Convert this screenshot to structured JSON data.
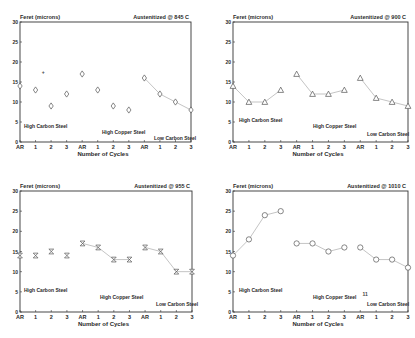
{
  "chart_data": [
    {
      "type": "line",
      "title": "Austenitized @ 845 C",
      "ylabel": "Feret (microns)",
      "xlabel": "Number of Cycles",
      "ylim": [
        0,
        30
      ],
      "yticks": [
        0,
        5,
        10,
        15,
        20,
        25,
        30
      ],
      "categories": [
        "AR",
        "1",
        "2",
        "3",
        "AR",
        "1",
        "2",
        "3",
        "AR",
        "1",
        "2",
        "3"
      ],
      "marker": "diamond",
      "grid": false,
      "series": [
        {
          "name": "High Carbon Steel",
          "values": [
            14,
            13,
            9,
            12
          ],
          "connected": false
        },
        {
          "name": "High Copper Steel",
          "values": [
            17,
            13,
            9,
            8
          ],
          "connected": false
        },
        {
          "name": "Low Carbon Steel",
          "values": [
            16,
            12,
            10,
            8
          ],
          "connected": true
        }
      ],
      "annotations": [
        {
          "text": "+",
          "x_index": 0.7,
          "y": 17
        }
      ]
    },
    {
      "type": "line",
      "title": "Austenitized @ 900 C",
      "ylabel": "Feret (microns)",
      "xlabel": "Number of Cycles",
      "ylim": [
        0,
        30
      ],
      "yticks": [
        0,
        5,
        10,
        15,
        20,
        25,
        30
      ],
      "categories": [
        "AR",
        "1",
        "2",
        "3",
        "AR",
        "1",
        "2",
        "3",
        "AR",
        "1",
        "2",
        "3"
      ],
      "marker": "triangle",
      "grid": false,
      "series": [
        {
          "name": "High Carbon Steel",
          "values": [
            14,
            10,
            10,
            13
          ],
          "connected": true
        },
        {
          "name": "High Copper Steel",
          "values": [
            17,
            12,
            12,
            13
          ],
          "connected": true
        },
        {
          "name": "Low Carbon Steel",
          "values": [
            16,
            11,
            10,
            9
          ],
          "connected": true
        }
      ]
    },
    {
      "type": "line",
      "title": "Austenitized @ 955 C",
      "ylabel": "Feret (microns)",
      "xlabel": "Number of Cycles",
      "ylim": [
        0,
        30
      ],
      "yticks": [
        0,
        5,
        10,
        15,
        20,
        25,
        30
      ],
      "categories": [
        "AR",
        "1",
        "2",
        "3",
        "AR",
        "1",
        "2",
        "3",
        "AR",
        "1",
        "2",
        "3"
      ],
      "marker": "hourglass",
      "grid": false,
      "series": [
        {
          "name": "High Carbon Steel",
          "values": [
            14,
            14,
            15,
            14
          ],
          "connected": false
        },
        {
          "name": "High Copper Steel",
          "values": [
            17,
            16,
            13,
            13
          ],
          "connected": true
        },
        {
          "name": "Low Carbon Steel",
          "values": [
            16,
            15,
            10,
            10
          ],
          "connected": true
        }
      ]
    },
    {
      "type": "line",
      "title": "Austenitized @ 1010 C",
      "ylabel": "Feret (microns)",
      "xlabel": "Number of Cycles",
      "ylim": [
        0,
        30
      ],
      "yticks": [
        0,
        5,
        10,
        15,
        20,
        25,
        30
      ],
      "categories": [
        "AR",
        "1",
        "2",
        "3",
        "AR",
        "1",
        "2",
        "3",
        "AR",
        "1",
        "2",
        "3"
      ],
      "marker": "circle",
      "grid": false,
      "series": [
        {
          "name": "High Carbon Steel",
          "values": [
            14,
            18,
            24,
            25
          ],
          "connected": true
        },
        {
          "name": "High Copper Steel",
          "values": [
            17,
            17,
            15,
            16
          ],
          "connected": true
        },
        {
          "name": "Low Carbon Steel",
          "values": [
            16,
            13,
            13,
            11
          ],
          "connected": true
        }
      ],
      "annotations": [
        {
          "text": "11",
          "x_index": 8.5,
          "y": 3.5
        }
      ]
    }
  ],
  "panels": [
    {
      "ylabel": "Feret (microns)",
      "title": "Austenitized @ 845 C",
      "xlabel": "Number of Cycles",
      "labels": {
        "hc": "High Carbon Steel",
        "hcu": "High Copper Steel",
        "lc": "Low Carbon Steel"
      }
    },
    {
      "ylabel": "Feret (microns)",
      "title": "Austenitized @ 900 C",
      "xlabel": "Number of Cycles",
      "labels": {
        "hc": "High Carbon Steel",
        "hcu": "High Copper Steel",
        "lc": "Low Carbon Steel"
      }
    },
    {
      "ylabel": "Feret (microns)",
      "title": "Austenitized @ 955 C",
      "xlabel": "Number of Cycles",
      "labels": {
        "hc": "High Carbon Steel",
        "hcu": "High Copper Steel",
        "lc": "Low Carbon Steel"
      }
    },
    {
      "ylabel": "Feret (microns)",
      "title": "Austenitized @ 1010 C",
      "xlabel": "Number of Cycles",
      "labels": {
        "hc": "High Carbon Steel",
        "hcu": "High Copper Steel",
        "lc": "Low Carbon Steel"
      }
    }
  ]
}
